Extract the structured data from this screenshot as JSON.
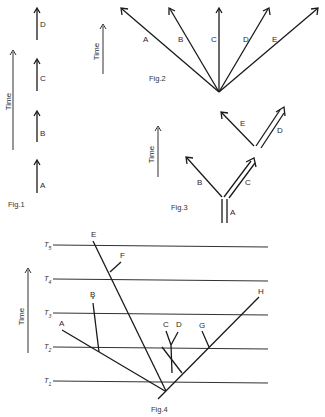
{
  "fig1": {
    "caption": "Fig.1",
    "axis_label": "Time",
    "arrows": [
      {
        "label": "D"
      },
      {
        "label": "C"
      },
      {
        "label": "B"
      },
      {
        "label": "A"
      }
    ]
  },
  "fig2": {
    "caption": "Fig.2",
    "axis_label": "Time",
    "branches": [
      {
        "label": "A"
      },
      {
        "label": "B"
      },
      {
        "label": "C"
      },
      {
        "label": "D"
      },
      {
        "label": "E"
      }
    ]
  },
  "fig3": {
    "caption": "Fig.3",
    "axis_label": "Time",
    "branches": [
      {
        "label": "A"
      },
      {
        "label": "B"
      },
      {
        "label": "C"
      },
      {
        "label": "D"
      },
      {
        "label": "E"
      }
    ]
  },
  "fig4": {
    "caption": "Fig.4",
    "axis_label": "Time",
    "time_levels": [
      {
        "label": "T",
        "sub": "5"
      },
      {
        "label": "T",
        "sub": "4"
      },
      {
        "label": "T",
        "sub": "3"
      },
      {
        "label": "T",
        "sub": "2"
      },
      {
        "label": "T",
        "sub": "1"
      }
    ],
    "taxa": [
      {
        "label": "E"
      },
      {
        "label": "F"
      },
      {
        "label": "B"
      },
      {
        "label": "A"
      },
      {
        "label": "C"
      },
      {
        "label": "D"
      },
      {
        "label": "G"
      },
      {
        "label": "H"
      }
    ]
  }
}
